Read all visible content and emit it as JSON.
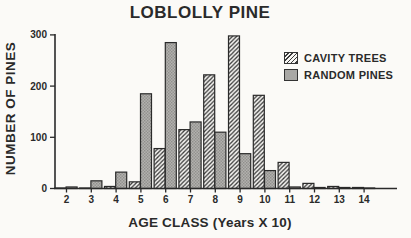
{
  "title": "LOBLOLLY PINE",
  "chart_data": {
    "type": "bar",
    "title": "LOBLOLLY PINE",
    "xlabel": "AGE CLASS (Years X 10)",
    "ylabel": "NUMBER OF PINES",
    "categories": [
      "2",
      "3",
      "4",
      "5",
      "6",
      "7",
      "8",
      "9",
      "10",
      "11",
      "12",
      "13",
      "14"
    ],
    "series": [
      {
        "name": "CAVITY TREES",
        "pattern": "diagonal-hatch",
        "values": [
          1,
          1,
          4,
          13,
          78,
          115,
          222,
          298,
          182,
          51,
          10,
          4,
          2
        ]
      },
      {
        "name": "RANDOM PINES",
        "pattern": "gray-stipple",
        "values": [
          3,
          15,
          32,
          185,
          285,
          130,
          110,
          68,
          35,
          3,
          2,
          2,
          1
        ]
      }
    ],
    "ylim": [
      0,
      300
    ],
    "yticks": [
      0,
      100,
      200,
      300
    ],
    "grid": false,
    "legend_position": "upper right"
  },
  "colors": {
    "ink": "#2a2a2a",
    "hatch_line": "#3a3a3a",
    "random_fill": "#b2b1ae",
    "random_dot": "#8f8e8b",
    "background": "#fbfaf7"
  }
}
